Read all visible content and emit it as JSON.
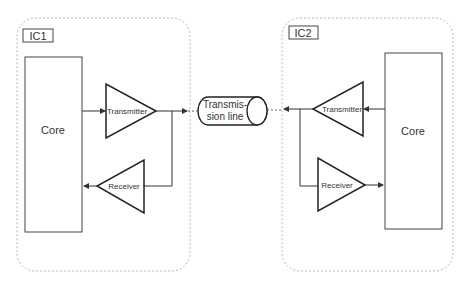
{
  "diagram": {
    "ic1": {
      "label": "IC1",
      "core_label": "Core",
      "transmitter_label": "Transmitter",
      "receiver_label": "Receiver"
    },
    "ic2": {
      "label": "IC2",
      "core_label": "Core",
      "transmitter_label": "Transmitter",
      "receiver_label": "Receiver"
    },
    "transmission_line": {
      "label_line1": "Transmis-",
      "label_line2": "sion line"
    },
    "colors": {
      "stroke": "#333333",
      "dashed_border": "#b8b8b8",
      "background": "#ffffff"
    }
  }
}
